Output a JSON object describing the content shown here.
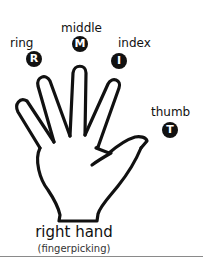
{
  "fingers": [
    {
      "key": "ring",
      "label": "ring",
      "badge": "R"
    },
    {
      "key": "middle",
      "label": "middle",
      "badge": "M"
    },
    {
      "key": "index",
      "label": "index",
      "badge": "I"
    },
    {
      "key": "thumb",
      "label": "thumb",
      "badge": "T"
    }
  ],
  "caption": {
    "title": "right hand",
    "subtitle": "(fingerpicking)"
  },
  "colors": {
    "ink": "#111111",
    "background": "#ffffff",
    "rule": "#8a8a8a"
  }
}
